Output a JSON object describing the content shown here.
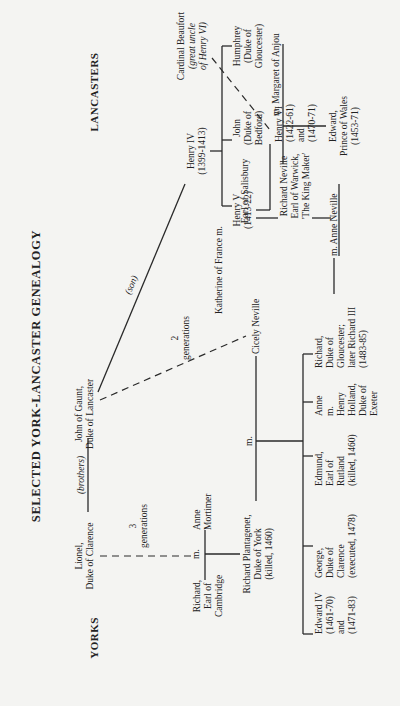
{
  "title": "SELECTED YORK-LANCASTER GENEALOGY",
  "headers": {
    "yorks": "YORKS",
    "lancasters": "LANCASTERS"
  },
  "labels": {
    "brothers": "(brothers)",
    "son": "(son)",
    "three": "3",
    "two": "2",
    "generations": "generations",
    "m": "m."
  },
  "people": {
    "lionel": [
      "Lionel,",
      "Duke of Clarence"
    ],
    "gaunt": [
      "John of Gaunt,",
      "Duke of Lancaster"
    ],
    "henry4": [
      "Henry IV",
      "(1399-1413)"
    ],
    "beaufort": [
      "Cardinal Beaufort",
      "(great uncle",
      "of Henry VI)"
    ],
    "henry5": [
      "Henry V",
      "(1413-22)"
    ],
    "john": [
      "John",
      "(Duke of",
      "Bedford)"
    ],
    "humphrey": [
      "Humphrey",
      "(Duke of",
      "Gloucester)"
    ],
    "katherine": [
      "Katherine of France m."
    ],
    "henry6": [
      "Henry VI",
      "(1422-61)",
      "and",
      "(1470-71)"
    ],
    "margaret": [
      "m. Margaret of Anjou"
    ],
    "edward_pw": [
      "Edward,",
      "Prince of Wales",
      "(1453-71)"
    ],
    "salisbury": [
      "Earl of Salisbury"
    ],
    "warwick": [
      "Richard Neville",
      "Earl of Warwick,",
      "'The King Maker'"
    ],
    "anne_neville": [
      "m. Anne Neville"
    ],
    "richard_cambridge": [
      "Richard,",
      "Earl of",
      "Cambridge"
    ],
    "anne_mortimer": [
      "Anne",
      "Mortimer"
    ],
    "richard_york": [
      "Richard Plantagenet,",
      "Duke of York",
      "(killed, 1460)"
    ],
    "cicely": [
      "Cicely Neville"
    ],
    "edward4": [
      "Edward IV",
      "(1461-70)",
      "and",
      "(1471-83)"
    ],
    "george": [
      "George,",
      "Duke of",
      "Clarence",
      "(executed, 1478)"
    ],
    "edmund": [
      "Edmund,",
      "Earl of",
      "Rutland",
      "(killed, 1460)"
    ],
    "anne_york": [
      "Anne",
      "m.",
      "Henry",
      "Holland,",
      "Duke of",
      "Exeter"
    ],
    "richard3": [
      "Richard,",
      "Duke of",
      "Gloucester;",
      "later Richard III",
      "(1483-85)"
    ]
  }
}
